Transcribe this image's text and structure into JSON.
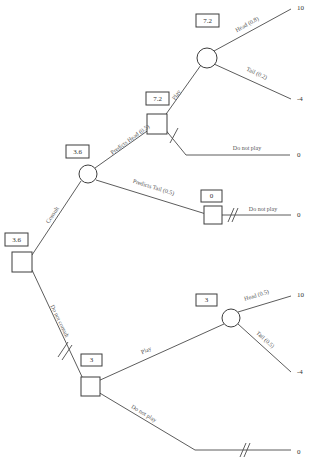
{
  "diagram": {
    "type": "decision-tree",
    "nodes": [
      {
        "id": "root",
        "kind": "decision",
        "value": "3.6",
        "x": 22,
        "y": 262
      },
      {
        "id": "consult-chance",
        "kind": "chance",
        "value": "3.6",
        "x": 88,
        "y": 174
      },
      {
        "id": "head-decision",
        "kind": "decision",
        "value": "7.2",
        "x": 157,
        "y": 124
      },
      {
        "id": "head-chance",
        "kind": "chance",
        "value": "7.2",
        "x": 207,
        "y": 58
      },
      {
        "id": "tail-decision",
        "kind": "decision",
        "value": "0",
        "x": 213,
        "y": 215
      },
      {
        "id": "noconsult-dec",
        "kind": "decision",
        "value": "3",
        "x": 91,
        "y": 387
      },
      {
        "id": "noconsult-ch",
        "kind": "chance",
        "value": "3",
        "x": 231,
        "y": 318
      }
    ],
    "edges": [
      {
        "id": "e-consult",
        "label": "Consult",
        "pruned": false
      },
      {
        "id": "e-no-consult",
        "label": "Do not consult",
        "pruned": true
      },
      {
        "id": "e-predicts-head",
        "label": "Predicts Head (0.5)",
        "pruned": false
      },
      {
        "id": "e-predicts-tail",
        "label": "Predicts Tail (0.5)",
        "pruned": false
      },
      {
        "id": "e-play-top",
        "label": "Play",
        "pruned": false
      },
      {
        "id": "e-donotplay-top",
        "label": "Do not play",
        "pruned": true
      },
      {
        "id": "e-head-top",
        "label": "Head (0.8)",
        "pruned": false
      },
      {
        "id": "e-tail-top",
        "label": "Tail (0.2)",
        "pruned": false
      },
      {
        "id": "e-donotplay-mid",
        "label": "Do not play",
        "pruned": true
      },
      {
        "id": "e-play-bottom",
        "label": "Play",
        "pruned": false
      },
      {
        "id": "e-donotplay-bot",
        "label": "Do not play",
        "pruned": true
      },
      {
        "id": "e-head-bottom",
        "label": "Head (0.5)",
        "pruned": false
      },
      {
        "id": "e-tail-bottom",
        "label": "Tail (0.5)",
        "pruned": false
      }
    ],
    "payoffs": [
      {
        "id": "p-head-top",
        "value": "10",
        "x": 297,
        "y": 8
      },
      {
        "id": "p-tail-top",
        "value": "-4",
        "x": 297,
        "y": 99
      },
      {
        "id": "p-donotplay-top",
        "value": "0",
        "x": 297,
        "y": 155
      },
      {
        "id": "p-donotplay-mid",
        "value": "0",
        "x": 297,
        "y": 215
      },
      {
        "id": "p-head-bottom",
        "value": "10",
        "x": 297,
        "y": 295
      },
      {
        "id": "p-tail-bottom",
        "value": "-4",
        "x": 297,
        "y": 372
      },
      {
        "id": "p-donotplay-bot",
        "value": "0",
        "x": 297,
        "y": 452
      }
    ],
    "colors": {
      "line": "#4a4a4a",
      "node_stroke": "#3d3d3d",
      "text": "#333333",
      "label_text": "#555555",
      "background": "#ffffff"
    }
  }
}
